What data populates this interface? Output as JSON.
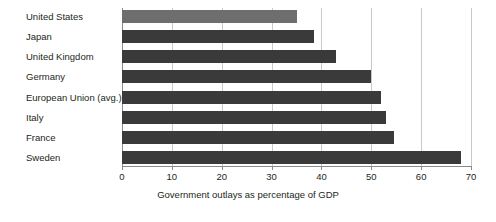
{
  "chart_data": {
    "type": "bar",
    "orientation": "horizontal",
    "title": "",
    "subtitle": "",
    "xlabel": "Government outlays as percentage of GDP",
    "ylabel": "",
    "xlim": [
      0,
      70
    ],
    "xticks": [
      0,
      10,
      20,
      30,
      40,
      50,
      60,
      70
    ],
    "xtick_labels": [
      "0",
      "10",
      "20",
      "30",
      "40",
      "50",
      "60",
      "70"
    ],
    "grid": true,
    "legend": "none",
    "categories": [
      "United States",
      "Japan",
      "United Kingdom",
      "Germany",
      "European Union (avg.)",
      "Italy",
      "France",
      "Sweden"
    ],
    "values": [
      35,
      38.5,
      43,
      50,
      52,
      53,
      54.5,
      68
    ],
    "bar_colors": [
      "#6e6e6e",
      "#3a3a3a",
      "#3a3a3a",
      "#3a3a3a",
      "#3a3a3a",
      "#3a3a3a",
      "#3a3a3a",
      "#3a3a3a"
    ],
    "highlight_category": "United States",
    "gridline_color": "#c9c9c9",
    "axis_color": "#8a8a8a",
    "text_color": "#231f20",
    "background": "#ffffff"
  }
}
